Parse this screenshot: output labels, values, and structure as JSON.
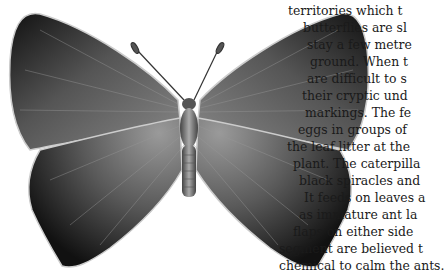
{
  "page": {
    "illustration": {
      "subject": "butterfly",
      "style": "monochrome engraving"
    },
    "body_text": {
      "top_partial_line": "",
      "lines": [
        "territories which t",
        "butterflies are sl",
        "stay a few metre",
        "ground. When t",
        "are difficult to s",
        "their cryptic und",
        "markings. The fe",
        "eggs in groups of",
        "the leaf litter at the",
        "plant. The caterpilla",
        "black spiracles and",
        "It feeds on leaves a",
        "as immature ant la",
        "flaps on either side",
        "segment are believed t",
        "chemical to calm the ants."
      ]
    }
  }
}
